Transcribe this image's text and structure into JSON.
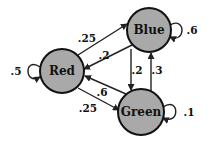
{
  "diagram": {
    "type": "markov-chain",
    "fill_color": "#a9a9a9",
    "nodes": [
      {
        "id": "red",
        "label": "Red",
        "cx": 62,
        "cy": 71,
        "r": 22
      },
      {
        "id": "blue",
        "label": "Blue",
        "cx": 149,
        "cy": 30,
        "r": 22
      },
      {
        "id": "green",
        "label": "Green",
        "cx": 141,
        "cy": 112,
        "r": 23
      }
    ],
    "edges": [
      {
        "from": "Red",
        "to": "Red",
        "label": ".5"
      },
      {
        "from": "Red",
        "to": "Blue",
        "label": ".25"
      },
      {
        "from": "Red",
        "to": "Green",
        "label": ".25"
      },
      {
        "from": "Blue",
        "to": "Blue",
        "label": ".6"
      },
      {
        "from": "Blue",
        "to": "Red",
        "label": ".2"
      },
      {
        "from": "Blue",
        "to": "Green",
        "label": ".2"
      },
      {
        "from": "Green",
        "to": "Green",
        "label": ".1"
      },
      {
        "from": "Green",
        "to": "Red",
        "label": ".6"
      },
      {
        "from": "Green",
        "to": "Blue",
        "label": ".3"
      }
    ]
  }
}
